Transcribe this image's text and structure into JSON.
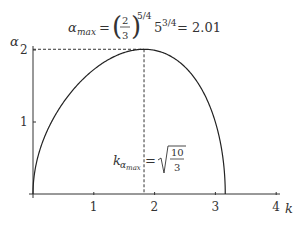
{
  "chart_data": {
    "type": "line",
    "title": "",
    "xlabel": "k",
    "ylabel": "α",
    "xlim": [
      0,
      4
    ],
    "ylim": [
      0,
      2.1
    ],
    "x_ticks": [
      "1",
      "2",
      "3",
      "4"
    ],
    "y_ticks": [
      "1",
      "2"
    ],
    "grid": false,
    "legend": null,
    "series": [
      {
        "name": "α(k)",
        "x": [
          0,
          0.05,
          0.2,
          0.4,
          0.6,
          0.8,
          1.0,
          1.2,
          1.4,
          1.6,
          1.826,
          2.0,
          2.2,
          2.4,
          2.6,
          2.8,
          3.0,
          3.1,
          3.162
        ],
        "values": [
          0,
          0.41,
          0.81,
          1.15,
          1.4,
          1.6,
          1.73,
          1.85,
          1.94,
          1.99,
          2.01,
          1.99,
          1.93,
          1.81,
          1.62,
          1.34,
          0.89,
          0.55,
          0
        ]
      }
    ],
    "annotations": {
      "alpha_max": {
        "lhs": "α",
        "lhs_sub": "max",
        "eq": "=",
        "frac_num": "2",
        "frac_den": "3",
        "exp1": "5/4",
        "base2": "5",
        "exp2": "3/4",
        "result": "= 2.01",
        "value": 2.01
      },
      "k_alpha_max": {
        "lhs": "k",
        "lhs_sub": "α",
        "lhs_subsub": "max",
        "eq": "=",
        "sqrt_num": "10",
        "sqrt_den": "3",
        "value": 1.826
      }
    }
  }
}
